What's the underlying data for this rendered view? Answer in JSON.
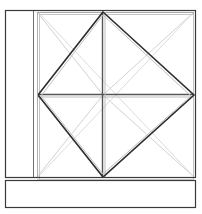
{
  "document": {
    "kind": "line-drawing",
    "subject": "window-elevation-with-diamond-muntin-pattern",
    "background_color": "#ffffff",
    "canvas": {
      "width": 202,
      "height": 214
    }
  },
  "palette": {
    "frame_dark": "#2b2b2b",
    "frame_mid": "#4a4a4a",
    "frame_light": "#8c8c8c",
    "hairline": "#b8b8b8",
    "diagonal_faint": "#c9c9c9",
    "diagonal_pale": "#d8d8d8",
    "white": "#ffffff"
  },
  "geometry": {
    "outer_frame": {
      "x1": 5,
      "y1": 10,
      "x2": 196,
      "y2": 177
    },
    "sill_panel": {
      "x1": 5,
      "y1": 180,
      "x2": 196,
      "y2": 208
    },
    "left_mullion_outer_x": 33,
    "left_mullion_inner_x": 37,
    "inner_sash": {
      "x1": 37,
      "y1": 12,
      "x2": 194,
      "y2": 178
    },
    "center": {
      "x": 103,
      "y": 95
    },
    "diamond": {
      "top": {
        "x": 103,
        "y": 12
      },
      "right": {
        "x": 194,
        "y": 95
      },
      "bottom": {
        "x": 103,
        "y": 177
      },
      "left": {
        "x": 38,
        "y": 95
      }
    },
    "horizontal_rail_y": 95,
    "vertical_rail_x": 103
  },
  "elements": {
    "outer_frame_label": "outer-window-frame",
    "sill_label": "window-sill-panel",
    "mullion_label": "left-vertical-mullion",
    "sash_label": "inner-sash-frame",
    "diamond_label": "diamond-muntin",
    "rail_h_label": "horizontal-center-rail",
    "rail_v_label": "vertical-center-rail",
    "diagonals_label": "corner-diagonal-guides"
  }
}
